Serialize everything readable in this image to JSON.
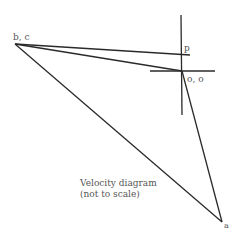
{
  "diagram": {
    "title": "Velocity diagram",
    "subtitle": "(not to scale)",
    "points": {
      "bc": {
        "label": "b, c",
        "x": 15,
        "y": 44
      },
      "p": {
        "label": "p",
        "x": 181,
        "y": 55
      },
      "o": {
        "label": "o, o",
        "x": 182,
        "y": 71
      },
      "a": {
        "label": "a",
        "x": 222,
        "y": 222
      }
    },
    "colors": {
      "line": "#2a2a2a",
      "text": "#555555"
    }
  }
}
